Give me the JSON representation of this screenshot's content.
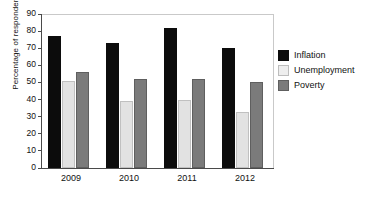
{
  "chart_data": {
    "type": "bar",
    "title": "",
    "subtitle": "",
    "xlabel": "",
    "ylabel": "Percentage of respondents",
    "categories": [
      "2009",
      "2010",
      "2011",
      "2012"
    ],
    "series": [
      {
        "name": "Inflation",
        "color": "#0c0c0c",
        "values": [
          77,
          73,
          82,
          70
        ]
      },
      {
        "name": "Unemployment",
        "color": "#e2e2e2",
        "values": [
          51,
          39,
          40,
          33
        ]
      },
      {
        "name": "Poverty",
        "color": "#7b7b7b",
        "values": [
          56,
          52,
          52,
          50
        ]
      }
    ],
    "ylim": [
      0,
      90
    ],
    "ytick_step": 10,
    "yticks": [
      "0",
      "10",
      "20",
      "30",
      "40",
      "50",
      "60",
      "70",
      "80",
      "90"
    ],
    "grid": false,
    "legend_position": "right",
    "annotations": []
  }
}
